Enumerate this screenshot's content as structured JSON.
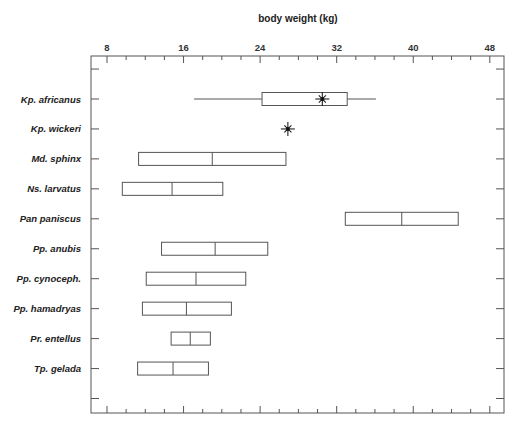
{
  "chart_data": {
    "type": "boxplot",
    "title": "body weight (kg)",
    "xlabel": "body weight (kg)",
    "ylabel": "",
    "xlim": [
      6.5,
      49.7
    ],
    "x_ticks_major": [
      8,
      16,
      24,
      32,
      40,
      48
    ],
    "x_ticks_minor_step": 2,
    "axis_position": "top",
    "grid": false,
    "legend": null,
    "categories": [
      "Kp. africanus",
      "Kp. wickeri",
      "Md. sphinx",
      "Ns. larvatus",
      "Pan paniscus",
      "Pp. anubis",
      "Pp. cynoceph.",
      "Pp. hamadryas",
      "Pr. entellus",
      "Tp. gelada"
    ],
    "series": [
      {
        "label": "Kp. africanus",
        "whisker_low": 17.1,
        "box_low": 24.2,
        "median": null,
        "box_high": 33.1,
        "whisker_high": 36.1,
        "point": 30.5
      },
      {
        "label": "Kp. wickeri",
        "whisker_low": null,
        "box_low": null,
        "median": null,
        "box_high": null,
        "whisker_high": null,
        "point": 26.9
      },
      {
        "label": "Md. sphinx",
        "whisker_low": null,
        "box_low": 11.3,
        "median": 19.0,
        "box_high": 26.7,
        "whisker_high": null,
        "point": null
      },
      {
        "label": "Ns. larvatus",
        "whisker_low": null,
        "box_low": 9.6,
        "median": 14.8,
        "box_high": 20.1,
        "whisker_high": null,
        "point": null
      },
      {
        "label": "Pan paniscus",
        "whisker_low": null,
        "box_low": 32.9,
        "median": 38.8,
        "box_high": 44.7,
        "whisker_high": null,
        "point": null
      },
      {
        "label": "Pp. anubis",
        "whisker_low": null,
        "box_low": 13.7,
        "median": 19.3,
        "box_high": 24.8,
        "whisker_high": null,
        "point": null
      },
      {
        "label": "Pp. cynoceph.",
        "whisker_low": null,
        "box_low": 12.1,
        "median": 17.3,
        "box_high": 22.5,
        "whisker_high": null,
        "point": null
      },
      {
        "label": "Pp. hamadryas",
        "whisker_low": null,
        "box_low": 11.7,
        "median": 16.3,
        "box_high": 21.0,
        "whisker_high": null,
        "point": null
      },
      {
        "label": "Pr. entellus",
        "whisker_low": null,
        "box_low": 14.7,
        "median": 16.7,
        "box_high": 18.8,
        "whisker_high": null,
        "point": null
      },
      {
        "label": "Tp. gelada",
        "whisker_low": null,
        "box_low": 11.2,
        "median": 14.9,
        "box_high": 18.6,
        "whisker_high": null,
        "point": null
      }
    ],
    "annotations": [
      "asterisk markers denote individual specimen values (Kp. africanus, Kp. wickeri)"
    ]
  }
}
